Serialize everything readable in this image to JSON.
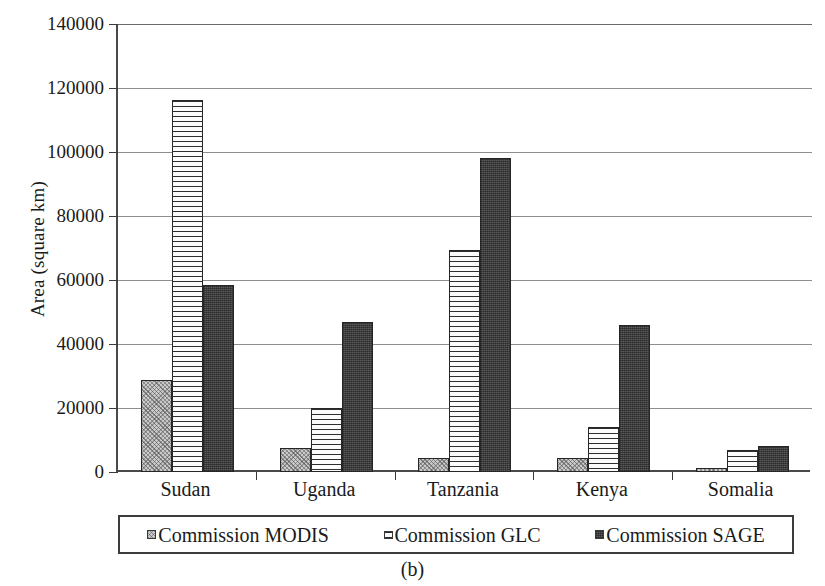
{
  "figure": {
    "caption": "(b)",
    "ylabel": "Area (square km)"
  },
  "chart_data": {
    "type": "bar",
    "title": "",
    "xlabel": "",
    "ylabel": "Area (square km)",
    "ylim": [
      0,
      140000
    ],
    "ytick_labels": [
      "140000",
      "120000",
      "100000",
      "80000",
      "60000",
      "40000",
      "20000",
      "0"
    ],
    "ytick_values": [
      140000,
      120000,
      100000,
      80000,
      60000,
      40000,
      20000,
      0
    ],
    "grid": true,
    "legend_position": "below-axes",
    "categories": [
      "Sudan",
      "Uganda",
      "Tanzania",
      "Kenya",
      "Somalia"
    ],
    "series": [
      {
        "name": "Commission MODIS",
        "pattern": "stipple-light",
        "color": "#c9c9c9",
        "values": [
          28700,
          7500,
          4500,
          4500,
          1300
        ]
      },
      {
        "name": "Commission GLC",
        "pattern": "horizontal-stripes",
        "color": "#fbfbfb",
        "values": [
          116300,
          20000,
          69500,
          14000,
          7000
        ]
      },
      {
        "name": "Commission SAGE",
        "pattern": "dark-solid",
        "color": "#5a5a5a",
        "values": [
          58500,
          47000,
          98000,
          46000,
          8000
        ]
      }
    ]
  }
}
